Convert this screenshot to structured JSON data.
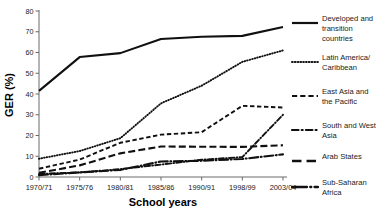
{
  "chart_data": {
    "type": "line",
    "title": "",
    "xlabel": "School years",
    "ylabel": "GER (%)",
    "categories": [
      "1970/71",
      "1975/76",
      "1980/81",
      "1985/86",
      "1990/91",
      "1998/99",
      "2003/04"
    ],
    "ylim": [
      0,
      80
    ],
    "yticks": [
      0,
      10,
      20,
      30,
      40,
      50,
      60,
      70,
      80
    ],
    "grid": false,
    "legend_position": "right",
    "series": [
      {
        "name": "Developed and transition countries",
        "style": "solid",
        "values": [
          41.5,
          57.8,
          59.7,
          66.5,
          67.6,
          68.0,
          72.3
        ]
      },
      {
        "name": "Latin America/ Caribbean",
        "style": "dotted",
        "values": [
          8.8,
          12.5,
          18.7,
          35.5,
          44.0,
          55.5,
          61.0
        ]
      },
      {
        "name": "East Asia and the Pacific",
        "style": "dashed",
        "values": [
          4.0,
          8.4,
          16.5,
          20.4,
          21.6,
          34.3,
          33.5
        ]
      },
      {
        "name": "South and West Asia",
        "style": "dashdot",
        "values": [
          1.5,
          2.2,
          3.8,
          6.0,
          8.3,
          9.6,
          30.0
        ]
      },
      {
        "name": "Arab States",
        "style": "longdash",
        "values": [
          2.0,
          5.6,
          11.4,
          14.7,
          14.6,
          14.5,
          15.3
        ]
      },
      {
        "name": "Sub-Saharan Africa",
        "style": "longdashdot",
        "values": [
          0.9,
          2.2,
          3.4,
          7.5,
          7.8,
          8.7,
          10.9
        ]
      }
    ]
  },
  "axes": {
    "ylabel": "GER (%)",
    "xlabel": "School years",
    "yticks": [
      "0",
      "10",
      "20",
      "30",
      "40",
      "50",
      "60",
      "70",
      "80"
    ],
    "xticks": [
      "1970/71",
      "1975/76",
      "1980/81",
      "1985/86",
      "1990/91",
      "1998/99",
      "2003/04"
    ]
  },
  "legend": {
    "items": [
      {
        "label": "Developed and\ntransition\ncountries",
        "style": "solid"
      },
      {
        "label": "Latin America/\nCaribbean",
        "style": "dotted"
      },
      {
        "label": "East Asia and\nthe Pacific",
        "style": "dashed"
      },
      {
        "label": "South and West\nAsia",
        "style": "dashdot"
      },
      {
        "label": "Arab States",
        "style": "longdash"
      },
      {
        "label": "Sub-Saharan\nAfrica",
        "style": "longdashdot"
      }
    ]
  },
  "colors": {
    "line": "#101010",
    "axis": "#6b6b6b",
    "text": "#1a1a1a",
    "background": "#ffffff"
  }
}
